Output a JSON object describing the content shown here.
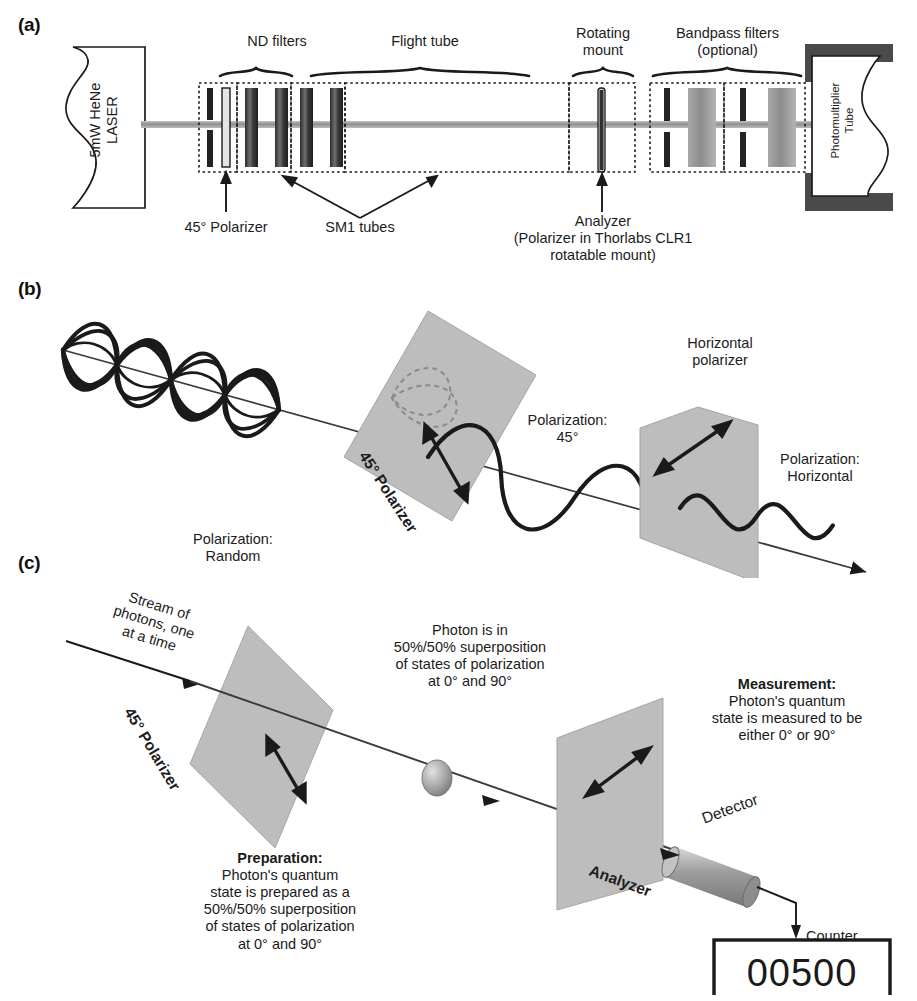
{
  "figure": {
    "panels": [
      {
        "id": "a",
        "label": "(a)"
      },
      {
        "id": "b",
        "label": "(b)"
      },
      {
        "id": "c",
        "label": "(c)"
      }
    ]
  },
  "panel_a": {
    "source_label": "5mW HeNe\nLASER",
    "detector_label": "Photomultiplier\nTube",
    "brackets": [
      {
        "name": "nd-filters",
        "label": "ND filters"
      },
      {
        "name": "flight-tube",
        "label": "Flight tube"
      },
      {
        "name": "rotating-mount",
        "label": "Rotating\nmount"
      },
      {
        "name": "bandpass-filters",
        "label": "Bandpass filters\n(optional)"
      }
    ],
    "callouts": [
      {
        "name": "polarizer-45",
        "label": "45° Polarizer"
      },
      {
        "name": "sm1-tubes",
        "label": "SM1 tubes"
      },
      {
        "name": "analyzer",
        "label": "Analyzer\n(Polarizer in Thorlabs CLR1\nrotatable mount)"
      }
    ]
  },
  "panel_b": {
    "labels": [
      {
        "name": "polarization-random",
        "label": "Polarization:\nRandom"
      },
      {
        "name": "polarizer-45-plane",
        "label": "45° Polarizer"
      },
      {
        "name": "polarization-45",
        "label": "Polarization:\n45°"
      },
      {
        "name": "horizontal-polarizer-plane",
        "label": "Horizontal\npolarizer"
      },
      {
        "name": "polarization-horizontal",
        "label": "Polarization:\nHorizontal"
      }
    ]
  },
  "panel_c": {
    "labels": [
      {
        "name": "photon-stream",
        "label": "Stream of\nphotons, one\nat a time"
      },
      {
        "name": "polarizer-45-plane",
        "label": "45° Polarizer"
      },
      {
        "name": "superposition-note",
        "label": "Photon is in\n50%/50% superposition\nof states of polarization\nat 0° and 90°"
      },
      {
        "name": "analyzer-plane",
        "label": "Analyzer"
      },
      {
        "name": "detector",
        "label": "Detector"
      },
      {
        "name": "counter",
        "label": "Counter"
      }
    ],
    "preparation": {
      "heading": "Preparation:",
      "body": "Photon's quantum\nstate is prepared as a\n50%/50% superposition\nof states of polarization\nat 0° and 90°"
    },
    "measurement": {
      "heading": "Measurement:",
      "body": "Photon's quantum\nstate is measured to be\neither 0° or 90°"
    },
    "counter_value": "00500"
  },
  "colors": {
    "ink": "#1a1a1a",
    "plane_fill": "#b9b9b9",
    "filter_dark": "#2b2b2b",
    "filter_light": "#c9c9c9",
    "housing": "#4a4a4a",
    "beam": "#9a9a9a"
  }
}
